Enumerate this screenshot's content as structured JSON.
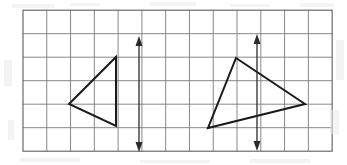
{
  "figure": {
    "canvas": {
      "width": 347,
      "height": 165,
      "background": "#ffffff"
    },
    "grid": {
      "name": "square-grid",
      "origin_x": 23,
      "origin_y": 10.2,
      "cell_width": 23.78,
      "cell_height": 23.5,
      "columns": 13,
      "rows": 6,
      "line_color": "#7a7a7f",
      "line_width": 0.9,
      "border_color": "#5d5d62",
      "border_width": 1.1
    },
    "shapes": [
      {
        "name": "left-triangle",
        "type": "triangle",
        "label": "Triangle A",
        "stroke": "#1a1a1a",
        "stroke_width": 2.0,
        "fill": "none",
        "points": "116,57 116,126 69,104",
        "vertices": [
          {
            "name": "apex-top-right",
            "x": 116,
            "y": 57
          },
          {
            "name": "bottom-right",
            "x": 116,
            "y": 126
          },
          {
            "name": "left-point",
            "x": 69,
            "y": 104
          }
        ]
      },
      {
        "name": "right-triangle",
        "type": "triangle",
        "label": "Triangle B",
        "stroke": "#1a1a1a",
        "stroke_width": 2.0,
        "fill": "none",
        "points": "236,58 305,104 208,128",
        "vertices": [
          {
            "name": "apex-top",
            "x": 236,
            "y": 58
          },
          {
            "name": "right-point",
            "x": 305,
            "y": 104
          },
          {
            "name": "bottom-left",
            "x": 208,
            "y": 128
          }
        ]
      }
    ],
    "arrows": [
      {
        "name": "left-line-of-reflection",
        "type": "double-headed-vertical-arrow",
        "x": 139,
        "y_top": 36,
        "y_bottom": 152,
        "stroke": "#2a2a2a",
        "stroke_width": 1.3,
        "head_width": 7,
        "head_length": 10
      },
      {
        "name": "right-line-of-reflection",
        "type": "double-headed-vertical-arrow",
        "x": 257,
        "y_top": 34,
        "y_bottom": 151,
        "stroke": "#2a2a2a",
        "stroke_width": 1.3,
        "head_width": 7,
        "head_length": 10
      }
    ]
  }
}
